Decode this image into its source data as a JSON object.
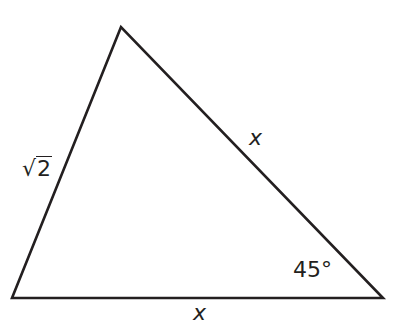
{
  "diagram": {
    "type": "triangle",
    "vertices": {
      "top": [
        121,
        27
      ],
      "bottom_left": [
        12,
        298
      ],
      "bottom_right": [
        383,
        298
      ]
    },
    "stroke_color": "#231f20",
    "labels": {
      "left_side": {
        "symbol": "√",
        "radicand": "2"
      },
      "right_side": "x",
      "bottom_side": "x",
      "angle_bottom_right": "45°"
    }
  }
}
